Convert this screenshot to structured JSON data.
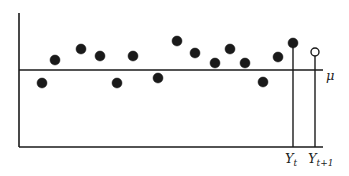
{
  "chart_data": {
    "type": "scatter",
    "title": "",
    "xlabel": "",
    "ylabel": "",
    "mean_label": "μ",
    "x_tick_labels": [
      {
        "main": "Y",
        "sub": "t"
      },
      {
        "main": "Y",
        "sub": "t+1"
      }
    ],
    "grid": false,
    "legend": null,
    "colors": {
      "ink": "#1a1a1a",
      "background": "#ffffff"
    },
    "axes": {
      "origin": [
        19,
        147
      ],
      "top": 13,
      "right": 323,
      "mean_y": 70
    },
    "points": [
      {
        "x": 42,
        "y": 83,
        "filled": true
      },
      {
        "x": 55,
        "y": 60,
        "filled": true
      },
      {
        "x": 81,
        "y": 49,
        "filled": true
      },
      {
        "x": 100,
        "y": 56,
        "filled": true
      },
      {
        "x": 117,
        "y": 83,
        "filled": true
      },
      {
        "x": 133,
        "y": 56,
        "filled": true
      },
      {
        "x": 158,
        "y": 78,
        "filled": true
      },
      {
        "x": 177,
        "y": 41,
        "filled": true
      },
      {
        "x": 195,
        "y": 53,
        "filled": true
      },
      {
        "x": 215,
        "y": 63,
        "filled": true
      },
      {
        "x": 230,
        "y": 49,
        "filled": true
      },
      {
        "x": 245,
        "y": 63,
        "filled": true
      },
      {
        "x": 263,
        "y": 82,
        "filled": true
      },
      {
        "x": 278,
        "y": 57,
        "filled": true
      },
      {
        "x": 293,
        "y": 43,
        "filled": true,
        "stem": true,
        "label_index": 0
      },
      {
        "x": 315,
        "y": 52,
        "filled": false,
        "stem": true,
        "label_index": 1
      }
    ],
    "note": "Time series of observations fluctuating around mean μ; last observed value Y_t (filled) and next value Y_{t+1} (open circle)."
  }
}
